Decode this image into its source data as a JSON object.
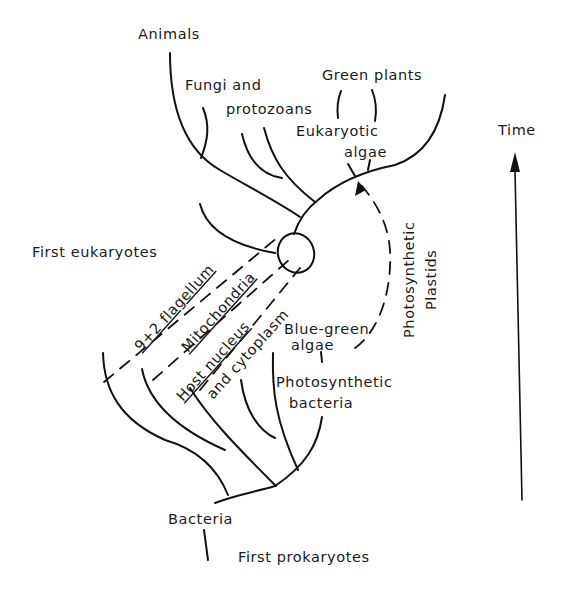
{
  "diagram": {
    "type": "phylogenetic-tree",
    "title": "",
    "axis": {
      "label": "Time",
      "direction": "up"
    },
    "labels": {
      "animals": "Animals",
      "fungi_line1": "Fungi and",
      "fungi_line2": "protozoans",
      "green_plants": "Green plants",
      "euk_algae_line1": "Eukaryotic",
      "euk_algae_line2": "algae",
      "first_eukaryotes": "First eukaryotes",
      "flagellum": "9+2 flagellum",
      "mitochondria": "Mitochondria",
      "host_nucleus": "Host nucleus",
      "and_cytoplasm": "and cytoplasm",
      "blue_green_line1": "Blue-green",
      "blue_green_line2": "algae",
      "photo_bact_line1": "Photosynthetic",
      "photo_bact_line2": "bacteria",
      "photo_plastids_line1": "Photosynthetic",
      "photo_plastids_line2": "Plastids",
      "bacteria": "Bacteria",
      "first_prokaryotes": "First prokaryotes",
      "time": "Time"
    },
    "colors": {
      "ink": "#111111",
      "background": "#ffffff"
    }
  }
}
